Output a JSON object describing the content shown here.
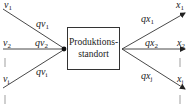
{
  "diagram": {
    "center_node": {
      "line1": "Produktions-",
      "line2": "standort"
    },
    "inputs": [
      {
        "source": "v",
        "source_sub": "1",
        "flow": "qv",
        "flow_sub": "1"
      },
      {
        "source": "v",
        "source_sub": "2",
        "flow": "qv",
        "flow_sub": "2"
      },
      {
        "source": "v",
        "source_sub": "i",
        "flow": "qv",
        "flow_sub": "i"
      }
    ],
    "outputs": [
      {
        "target": "x",
        "target_sub": "1",
        "flow": "qx",
        "flow_sub": "1"
      },
      {
        "target": "x",
        "target_sub": "2",
        "flow": "qx",
        "flow_sub": "2"
      },
      {
        "target": "x",
        "target_sub": "j",
        "flow": "qx",
        "flow_sub": "j"
      }
    ],
    "colors": {
      "line": "#333333",
      "text": "#222222",
      "background": "#ffffff"
    }
  }
}
